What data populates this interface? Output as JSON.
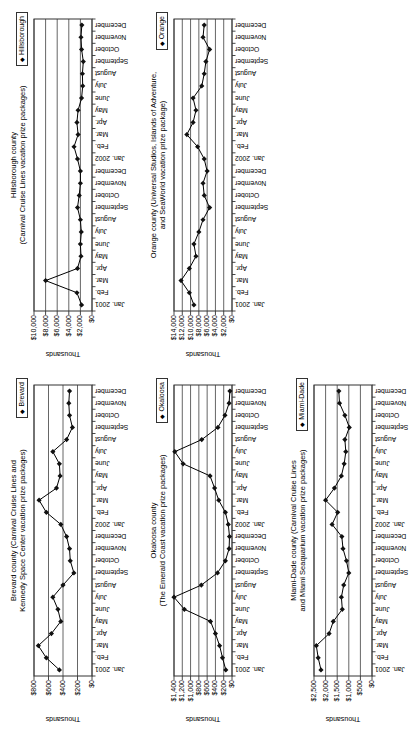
{
  "page": {
    "background": "#ffffff"
  },
  "colors": {
    "line": "#000000",
    "marker": "#111111",
    "grid": "#555555",
    "frame": "#333333",
    "text": "#000000",
    "legend_border": "#333333",
    "plot_bg": "#ffffff"
  },
  "chart_data": {
    "type": "line",
    "unit_label": "Thousands",
    "legend_marker": "◆",
    "categories": [
      "Jan. 2001",
      "Feb.",
      "Mar.",
      "Apr.",
      "May",
      "June",
      "July",
      "August",
      "September",
      "October",
      "November",
      "December",
      "Jan. 2002",
      "Feb.",
      "Mar.",
      "Apr.",
      "May",
      "June",
      "July",
      "August",
      "September",
      "October",
      "November",
      "December"
    ],
    "charts": [
      {
        "id": "hillsborough",
        "position": "top-left",
        "title_line1": "Hillsborough county",
        "title_line2": "(Carnival Cruise Lines vacation prize packages)",
        "legend": "Hillsborough",
        "ymax": 10000,
        "ystep": 2000,
        "ylim": [
          0,
          10000
        ],
        "ytick_labels": [
          "$10,000",
          "$8,000",
          "$6,000",
          "$4,000",
          "$2,000",
          "$0"
        ],
        "values": [
          1800,
          2600,
          8000,
          2500,
          1900,
          2000,
          1850,
          2000,
          2500,
          2200,
          2000,
          2000,
          2500,
          3100,
          2400,
          2600,
          2400,
          1800,
          1600,
          1650,
          1500,
          1800,
          1900,
          1750
        ]
      },
      {
        "id": "orange",
        "position": "top-middle",
        "title_line1": "Orange county (Universal Studios, Islands of Adventure,",
        "title_line2": "and SeaWorld vacation prize package)",
        "legend": "Orange",
        "ymax": 14000,
        "ystep": 2000,
        "ylim": [
          0,
          14000
        ],
        "ytick_labels": [
          "$14,000",
          "$12,000",
          "$10,000",
          "$8,000",
          "$6,000",
          "$4,000",
          "$2,000",
          "$0"
        ],
        "values": [
          9200,
          10300,
          12300,
          10300,
          8700,
          9200,
          8000,
          7000,
          5400,
          6700,
          7000,
          6000,
          6700,
          8300,
          10900,
          9400,
          8700,
          9400,
          7300,
          6700,
          6300,
          5400,
          7000,
          6700
        ]
      },
      {
        "id": "brevard",
        "position": "bottom-left",
        "title_line1": "Brevard county (Carnival Cruise Lines and",
        "title_line2": "Kennedy Space Center vacation prize packages)",
        "legend": "Brevard",
        "ymax": 800,
        "ystep": 200,
        "ylim": [
          0,
          800
        ],
        "ytick_labels": [
          "$800",
          "$600",
          "$400",
          "$200",
          "$0"
        ],
        "values": [
          450,
          630,
          740,
          560,
          430,
          470,
          540,
          400,
          250,
          300,
          310,
          350,
          430,
          630,
          730,
          490,
          440,
          450,
          540,
          350,
          270,
          310,
          320,
          310
        ]
      },
      {
        "id": "okaloosa",
        "position": "bottom-middle",
        "title_line1": "Okaloosa county",
        "title_line2": "(The Emerald Coast vacation prize packages)",
        "legend": "Okaloosa",
        "ymax": 1400,
        "ystep": 200,
        "ylim": [
          0,
          1400
        ],
        "ytick_labels": [
          "$1,400",
          "$1,200",
          "$1,000",
          "$800",
          "$600",
          "$400",
          "$200",
          "$0"
        ],
        "values": [
          150,
          230,
          300,
          400,
          520,
          1150,
          1400,
          740,
          350,
          160,
          70,
          60,
          90,
          160,
          320,
          420,
          530,
          1180,
          1380,
          730,
          340,
          170,
          70,
          50
        ]
      },
      {
        "id": "miami-dade",
        "position": "bottom-right",
        "title_line1": "Miami-Dade county (Carnival Cruise Lines",
        "title_line2": "and Miami Seaquarium vacation prize packages)",
        "legend": "Miami-Dade",
        "ymax": 2500,
        "ystep": 500,
        "ylim": [
          0,
          2500
        ],
        "ytick_labels": [
          "$2,500",
          "$2,000",
          "$1,500",
          "$1,000",
          "$500",
          "$0"
        ],
        "values": [
          2200,
          2320,
          2400,
          1850,
          1670,
          1280,
          1320,
          1220,
          1000,
          1100,
          1250,
          1300,
          1720,
          1480,
          2000,
          1620,
          1320,
          1200,
          1130,
          1170,
          980,
          1170,
          1400,
          1430
        ]
      }
    ]
  }
}
